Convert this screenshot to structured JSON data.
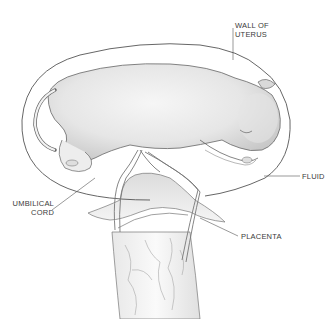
{
  "diagram": {
    "colors": {
      "ink": "#555555",
      "shade": "#bdbdbd",
      "light_shade": "#e2e2e2",
      "label_text": "#3a3a3a",
      "background": "#ffffff"
    },
    "labels": [
      {
        "id": "wall",
        "line1": "WALL OF",
        "line2": "UTERUS"
      },
      {
        "id": "fluid",
        "line1": "FLUID"
      },
      {
        "id": "cord",
        "line1": "UMBILICAL",
        "line2": "CORD"
      },
      {
        "id": "placenta",
        "line1": "PLACENTA"
      }
    ]
  }
}
